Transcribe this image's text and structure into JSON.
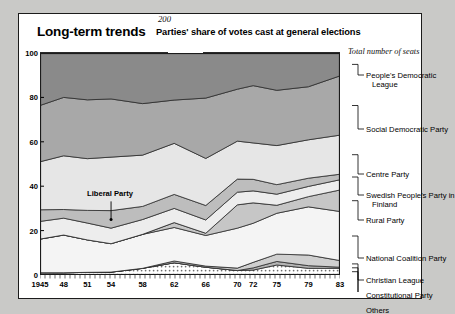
{
  "card": {
    "title": "Long-term trends",
    "subtitle": "Parties' share of votes cast at general elections",
    "seats_rule_label": "200",
    "seats_note": "Total number of seats",
    "inner_annotation": "Liberal Party"
  },
  "chart_data": {
    "type": "area",
    "title": "Long-term trends",
    "subtitle": "Parties' share of votes cast at general elections",
    "xlabel": "",
    "ylabel": "%",
    "ylim": [
      0,
      100
    ],
    "yticks": [
      0,
      20,
      40,
      60,
      80,
      100
    ],
    "grid": true,
    "stacked": true,
    "legend_position": "right-leader-lines",
    "annotations": [
      {
        "text": "200",
        "kind": "total-seats-rule"
      },
      {
        "text": "Total number of seats",
        "kind": "axis-note"
      },
      {
        "text": "Liberal Party",
        "kind": "in-plot-callout",
        "x": 1954
      }
    ],
    "x": [
      1945,
      1948,
      1951,
      1954,
      1958,
      1962,
      1966,
      1970,
      1972,
      1975,
      1979,
      1983
    ],
    "xticklabels": [
      "1945",
      "48",
      "51",
      "54",
      "58",
      "62",
      "66",
      "70",
      "72",
      "75",
      "79",
      "83"
    ],
    "series": [
      {
        "name": "Others",
        "color": "#fdfdfd",
        "pattern": "dotted",
        "values": [
          1.0,
          1.0,
          1.2,
          1.3,
          3.0,
          5.5,
          3.5,
          2.0,
          2.2,
          4.5,
          3.0,
          3.0
        ]
      },
      {
        "name": "Constitutional Party",
        "color": "#b4b4b4",
        "values": [
          0.0,
          0.0,
          0.0,
          0.0,
          0.0,
          0.0,
          0.0,
          0.0,
          1.0,
          1.6,
          1.2,
          0.5
        ]
      },
      {
        "name": "Christian League",
        "color": "#cfcfcf",
        "values": [
          0.0,
          0.0,
          0.0,
          0.0,
          0.0,
          0.8,
          0.5,
          1.1,
          2.5,
          3.3,
          4.8,
          3.0
        ]
      },
      {
        "name": "National Coalition Party",
        "color": "#f4f4f4",
        "values": [
          15.0,
          17.0,
          14.6,
          12.8,
          15.3,
          15.1,
          13.8,
          18.0,
          17.6,
          18.4,
          21.7,
          22.1
        ]
      },
      {
        "name": "Rural Party",
        "color": "#c6c6c6",
        "values": [
          0.0,
          0.0,
          0.0,
          0.0,
          0.0,
          2.2,
          1.0,
          10.5,
          9.2,
          3.6,
          4.6,
          9.7
        ]
      },
      {
        "name": "Swedish People's Party in Finland",
        "color": "#ededed",
        "values": [
          7.9,
          7.6,
          7.6,
          7.0,
          6.7,
          6.4,
          6.0,
          5.7,
          5.4,
          5.0,
          4.6,
          4.6
        ]
      },
      {
        "name": "Liberal Party",
        "color": "#bdbdbd",
        "values": [
          5.2,
          3.9,
          5.7,
          7.9,
          5.9,
          6.3,
          6.5,
          5.9,
          5.2,
          4.3,
          3.7,
          2.5
        ]
      },
      {
        "name": "Centre Party",
        "color": "#e6e6e6",
        "values": [
          21.4,
          24.2,
          23.3,
          24.1,
          23.1,
          23.0,
          21.2,
          17.1,
          16.4,
          17.6,
          17.3,
          17.6
        ]
      },
      {
        "name": "Social Democratic Party",
        "color": "#a8a8a8",
        "values": [
          25.1,
          26.3,
          26.5,
          26.2,
          23.2,
          19.5,
          27.2,
          23.4,
          25.8,
          24.9,
          23.9,
          26.7
        ]
      },
      {
        "name": "People's Democratic League",
        "color": "#8a8a8a",
        "values": [
          23.4,
          20.0,
          21.1,
          20.7,
          22.8,
          21.2,
          20.3,
          16.3,
          14.7,
          16.8,
          15.2,
          10.3
        ]
      }
    ]
  },
  "yaxis": {
    "unit": "%",
    "ticks": [
      "100",
      "80",
      "60",
      "40",
      "20",
      "0"
    ]
  },
  "xaxis": {
    "ticks": [
      "1945",
      "48",
      "51",
      "54",
      "58",
      "62",
      "66",
      "70",
      "72",
      "75",
      "79",
      "83"
    ]
  },
  "right_labels": [
    {
      "line1": "People's Democratic",
      "line2": "League"
    },
    {
      "line1": "Social Democratic Party",
      "line2": ""
    },
    {
      "line1": "Centre Party",
      "line2": ""
    },
    {
      "line1": "Swedish People's Party in",
      "line2": "Finland"
    },
    {
      "line1": "Rural Party",
      "line2": ""
    },
    {
      "line1": "National Coalition Party",
      "line2": ""
    },
    {
      "line1": "Christian League",
      "line2": ""
    },
    {
      "line1": "Constitutional Party",
      "line2": ""
    },
    {
      "line1": "Others",
      "line2": ""
    }
  ]
}
